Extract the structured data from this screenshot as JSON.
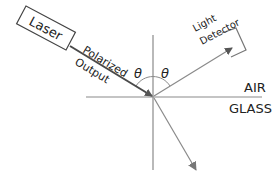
{
  "diagram": {
    "laser_label": "Laser",
    "beam_label_line1": "Polarized",
    "beam_label_line2": "Output",
    "incident_angle_symbol": "θ",
    "reflected_angle_symbol": "θ",
    "detector_label_line1": "Light",
    "detector_label_line2": "Detector",
    "upper_medium": "AIR",
    "lower_medium": "GLASS"
  },
  "colors": {
    "line": "#8a8a8a",
    "incident_beam": "#4a4a4a",
    "text": "#222222",
    "background": "#ffffff"
  }
}
